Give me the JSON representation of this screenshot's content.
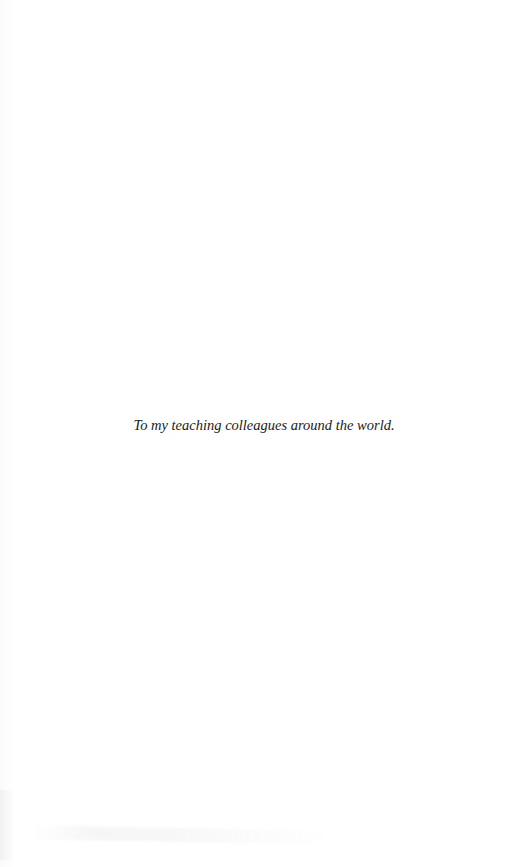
{
  "page": {
    "type": "dedication",
    "dedication_text": "To my teaching colleagues around the world.",
    "text_color": "#1a1a1a",
    "background_color": "#ffffff"
  }
}
